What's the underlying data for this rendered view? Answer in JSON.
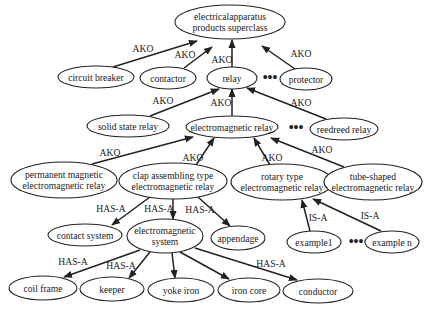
{
  "diagram": {
    "title": "",
    "nodes": [
      {
        "id": "superclass",
        "lines": [
          "electricalapparatus",
          "products superclass"
        ]
      },
      {
        "id": "circuit-breaker",
        "lines": [
          "circuit breaker"
        ]
      },
      {
        "id": "contactor",
        "lines": [
          "contactor"
        ]
      },
      {
        "id": "relay",
        "lines": [
          "relay"
        ]
      },
      {
        "id": "protector",
        "lines": [
          "protector"
        ]
      },
      {
        "id": "solid-state-relay",
        "lines": [
          "solid state relay"
        ]
      },
      {
        "id": "electromagnetic-relay",
        "lines": [
          "electromagnetic relay"
        ]
      },
      {
        "id": "reedreed-relay",
        "lines": [
          "reedreed relay"
        ]
      },
      {
        "id": "permanent-magnetic",
        "lines": [
          "permanent magnetic",
          "electromagnetic relay"
        ]
      },
      {
        "id": "clap-assembling",
        "lines": [
          "clap  assembling  type",
          "electromagnetic relay"
        ]
      },
      {
        "id": "rotary-type",
        "lines": [
          "rotary type",
          "electromagnetic relay"
        ]
      },
      {
        "id": "tube-shaped",
        "lines": [
          "tube-shaped",
          "electromagnetic relay"
        ]
      },
      {
        "id": "contact-system",
        "lines": [
          "contact system"
        ]
      },
      {
        "id": "electromagnetic-system",
        "lines": [
          "electromagnetic",
          "system"
        ]
      },
      {
        "id": "appendage",
        "lines": [
          "appendage"
        ]
      },
      {
        "id": "example1",
        "lines": [
          "example1"
        ]
      },
      {
        "id": "example-n",
        "lines": [
          "example n"
        ]
      },
      {
        "id": "coil-frame",
        "lines": [
          "coil frame"
        ]
      },
      {
        "id": "keeper",
        "lines": [
          "keeper"
        ]
      },
      {
        "id": "yoke-iron",
        "lines": [
          "yoke iron"
        ]
      },
      {
        "id": "iron-core",
        "lines": [
          "iron core"
        ]
      },
      {
        "id": "conductor",
        "lines": [
          "conductor"
        ]
      }
    ],
    "edges": [
      {
        "from": "circuit-breaker",
        "to": "superclass",
        "label": "AKO"
      },
      {
        "from": "contactor",
        "to": "superclass",
        "label": "AKO"
      },
      {
        "from": "relay",
        "to": "superclass",
        "label": "AKO"
      },
      {
        "from": "protector",
        "to": "superclass",
        "label": "AKO"
      },
      {
        "from": "solid-state-relay",
        "to": "relay",
        "label": "AKO"
      },
      {
        "from": "electromagnetic-relay",
        "to": "relay",
        "label": "AKO"
      },
      {
        "from": "reedreed-relay",
        "to": "relay",
        "label": "AKO"
      },
      {
        "from": "permanent-magnetic",
        "to": "electromagnetic-relay",
        "label": "AKO"
      },
      {
        "from": "clap-assembling",
        "to": "electromagnetic-relay",
        "label": "AKO"
      },
      {
        "from": "rotary-type",
        "to": "electromagnetic-relay",
        "label": "AKO"
      },
      {
        "from": "tube-shaped",
        "to": "electromagnetic-relay",
        "label": "AKO"
      },
      {
        "from": "clap-assembling",
        "to": "contact-system",
        "label": "HAS-A"
      },
      {
        "from": "clap-assembling",
        "to": "electromagnetic-system",
        "label": "HAS-A"
      },
      {
        "from": "clap-assembling",
        "to": "appendage",
        "label": "HAS-A"
      },
      {
        "from": "example1",
        "to": "rotary-type",
        "label": "IS-A"
      },
      {
        "from": "example-n",
        "to": "rotary-type",
        "label": "IS-A"
      },
      {
        "from": "electromagnetic-system",
        "to": "coil-frame",
        "label": "HAS-A"
      },
      {
        "from": "electromagnetic-system",
        "to": "keeper",
        "label": "HAS-A"
      },
      {
        "from": "electromagnetic-system",
        "to": "yoke-iron",
        "label": ""
      },
      {
        "from": "electromagnetic-system",
        "to": "iron-core",
        "label": ""
      },
      {
        "from": "electromagnetic-system",
        "to": "conductor",
        "label": "HAS-A"
      }
    ],
    "ellipsis": "•••"
  }
}
